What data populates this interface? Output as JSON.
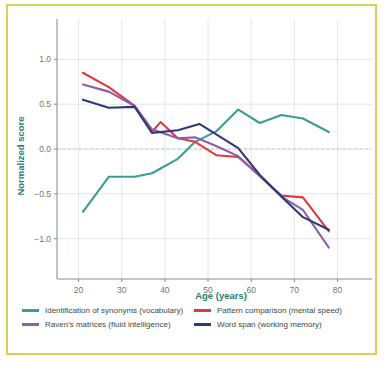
{
  "figure": {
    "border_color": "#d9cf5a",
    "background": "#ffffff"
  },
  "chart_data": {
    "type": "line",
    "title": "",
    "xlabel": "Age (years)",
    "ylabel": "Normalized score",
    "xlim": [
      15,
      88
    ],
    "ylim": [
      -1.45,
      1.45
    ],
    "xticks": [
      20,
      30,
      40,
      50,
      60,
      70,
      80
    ],
    "xtick_labels": [
      "20",
      "30",
      "40",
      "50",
      "60",
      "70",
      "80"
    ],
    "yticks": [
      1.0,
      0.5,
      0.0,
      -0.5,
      -1.0
    ],
    "ytick_labels": [
      "1.0",
      "0.5",
      "0.0",
      "−0.5",
      "−1.0"
    ],
    "grid": true,
    "zero_reference_line": 0.0,
    "legend_position": "below-axes",
    "series": [
      {
        "name": "Identification of synonyms (vocabulary)",
        "color": "#3d9c93",
        "x": [
          21,
          27,
          33,
          37,
          43,
          47,
          52,
          57,
          62,
          67,
          72,
          78
        ],
        "y": [
          -0.7,
          -0.31,
          -0.31,
          -0.27,
          -0.11,
          0.08,
          0.2,
          0.44,
          0.29,
          0.38,
          0.34,
          0.19
        ]
      },
      {
        "name": "Pattern comparison (mental speed)",
        "color": "#e0393e",
        "x": [
          21,
          27,
          33,
          37,
          39,
          43,
          47,
          52,
          57,
          62,
          67,
          72,
          78
        ],
        "y": [
          0.85,
          0.69,
          0.48,
          0.19,
          0.3,
          0.12,
          0.08,
          -0.07,
          -0.09,
          -0.3,
          -0.52,
          -0.54,
          -0.92
        ]
      },
      {
        "name": "Raven's matrices (fluid intelligence)",
        "color": "#8c5fa8",
        "x": [
          21,
          27,
          33,
          37,
          43,
          47,
          52,
          57,
          62,
          67,
          72,
          78
        ],
        "y": [
          0.72,
          0.64,
          0.48,
          0.22,
          0.12,
          0.13,
          0.03,
          -0.08,
          -0.3,
          -0.53,
          -0.68,
          -1.1
        ]
      },
      {
        "name": "Word span (working memory)",
        "color": "#2d3a7a",
        "x": [
          21,
          27,
          33,
          37,
          43,
          48,
          52,
          57,
          62,
          67,
          72,
          78
        ],
        "y": [
          0.55,
          0.46,
          0.47,
          0.18,
          0.21,
          0.28,
          0.16,
          0.01,
          -0.29,
          -0.53,
          -0.76,
          -0.9
        ]
      }
    ]
  },
  "legend": {
    "items": [
      {
        "label": "Identification of synonyms (vocabulary)",
        "color": "#3d9c93"
      },
      {
        "label": "Pattern comparison (mental speed)",
        "color": "#e0393e"
      },
      {
        "label": "Raven's matrices (fluid intelligence)",
        "color": "#8c5fa8"
      },
      {
        "label": "Word span (working memory)",
        "color": "#2d3a7a"
      }
    ]
  }
}
